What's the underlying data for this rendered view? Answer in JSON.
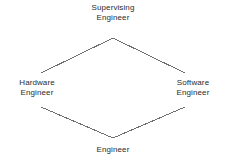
{
  "diagram": {
    "type": "hierarchy-diamond",
    "background_color": "#ffffff",
    "line_color": "#6f6f6f",
    "text_color": "#2b2b2b",
    "nodes": [
      {
        "id": "supervising",
        "label": "Supervising\nEngineer",
        "position": "top"
      },
      {
        "id": "hardware",
        "label": "Hardware\nEngineer",
        "position": "left"
      },
      {
        "id": "software",
        "label": "Software\nEngineer",
        "position": "right"
      },
      {
        "id": "engineer",
        "label": "Engineer",
        "position": "bottom"
      }
    ],
    "edges": [
      {
        "from": "supervising",
        "to": "hardware"
      },
      {
        "from": "supervising",
        "to": "software"
      },
      {
        "from": "hardware",
        "to": "engineer"
      },
      {
        "from": "software",
        "to": "engineer"
      }
    ]
  }
}
